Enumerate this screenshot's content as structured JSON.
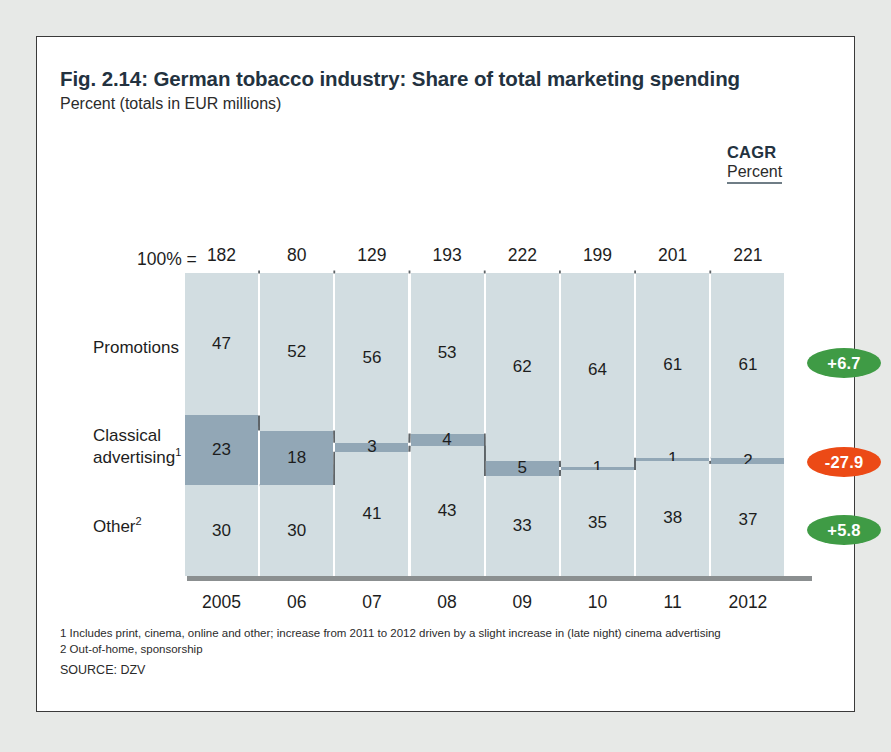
{
  "header": {
    "title": "Fig. 2.14: German tobacco industry: Share of total marketing spending",
    "subtitle": "Percent (totals in EUR millions)",
    "cagr_title": "CAGR",
    "cagr_sub": "Percent"
  },
  "axis": {
    "pct_label": "100% ="
  },
  "row_labels": {
    "promotions": "Promotions",
    "classical_1": "Classical",
    "classical_2": "advertising",
    "classical_sup": "1",
    "other": "Other",
    "other_sup": "2"
  },
  "footnotes": {
    "fn1": "1 Includes print, cinema, online and other; increase from 2011 to 2012 driven by a slight increase in (late night) cinema advertising",
    "fn2": "2 Out-of-home, sponsorship",
    "source": "SOURCE: DZV"
  },
  "colors": {
    "segment_light": "#d2dde1",
    "segment_dark": "#92a7b6",
    "positive_pill": "#3f9b45",
    "negative_pill": "#ec4a16",
    "baseline": "#8b8f90",
    "title": "#23323f"
  },
  "chart_data": {
    "type": "bar",
    "title": "Fig. 2.14: German tobacco industry: Share of total marketing spending",
    "subtitle": "Percent (totals in EUR millions)",
    "xlabel": "",
    "ylabel": "Percent",
    "ylim": [
      0,
      100
    ],
    "grid": false,
    "legend_position": "left-row-labels",
    "stacked": true,
    "categories": [
      "2005",
      "06",
      "07",
      "08",
      "09",
      "10",
      "11",
      "2012"
    ],
    "totals": [
      182,
      80,
      129,
      193,
      222,
      199,
      201,
      221
    ],
    "totals_label": "100% =",
    "series": [
      {
        "name": "Promotions",
        "values": [
          47,
          52,
          56,
          53,
          62,
          64,
          61,
          61
        ],
        "cagr": "+6.7",
        "cagr_sign": "positive"
      },
      {
        "name": "Classical advertising",
        "values": [
          23,
          18,
          3,
          4,
          5,
          1,
          1,
          2
        ],
        "cagr": "-27.9",
        "cagr_sign": "negative"
      },
      {
        "name": "Other",
        "values": [
          30,
          30,
          41,
          43,
          33,
          35,
          38,
          37
        ],
        "cagr": "+5.8",
        "cagr_sign": "positive"
      }
    ]
  }
}
